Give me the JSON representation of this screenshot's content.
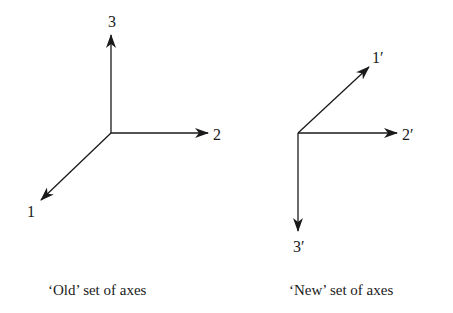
{
  "old_axes": {
    "caption": "‘Old’ set of axes",
    "labels": {
      "axis1": "1",
      "axis2": "2",
      "axis3": "3"
    }
  },
  "new_axes": {
    "caption": "‘New’ set of axes",
    "labels": {
      "axis1": "1′",
      "axis2": "2′",
      "axis3": "3′"
    }
  },
  "colors": {
    "stroke": "#1a1a1a",
    "background": "#ffffff"
  }
}
